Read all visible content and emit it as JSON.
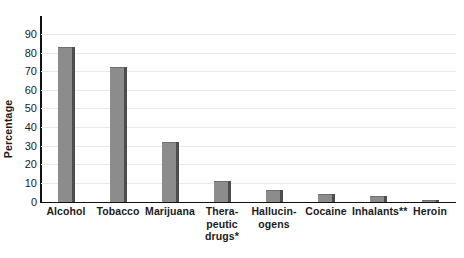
{
  "chart_data": {
    "type": "bar",
    "title": "",
    "subtitle": "",
    "xlabel": "",
    "ylabel": "Percentage",
    "ylim": [
      0,
      90
    ],
    "ytick_step": 10,
    "yticks": [
      90,
      80,
      70,
      60,
      50,
      40,
      30,
      20,
      10,
      0
    ],
    "grid": true,
    "grid_axis": "y",
    "legend": false,
    "legend_position": "none",
    "categories": [
      "Alcohol",
      "Tobacco",
      "Marijuana",
      "Therapeutic drugs*",
      "Hallucinogens",
      "Cocaine",
      "Inhalants**",
      "Heroin"
    ],
    "category_label_lines": [
      [
        "Alcohol"
      ],
      [
        "Tobacco"
      ],
      [
        "Marijuana"
      ],
      [
        "Thera-",
        "peutic",
        "drugs*"
      ],
      [
        "Hallucin-",
        "ogens"
      ],
      [
        "Cocaine"
      ],
      [
        "Inhalants**"
      ],
      [
        "Heroin"
      ]
    ],
    "values": [
      83,
      72.5,
      32,
      11,
      6,
      4,
      3,
      1
    ],
    "bar_color": "#8c8c8c",
    "bar_shadow_color": "#4d4d4d",
    "axis_color": "#111111",
    "gridline_color": "#e9e9e9",
    "background_color": "#ffffff",
    "text_color": "#1b1b1b"
  }
}
